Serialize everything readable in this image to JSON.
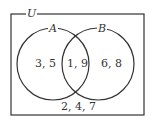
{
  "universe": {
    "label": "U",
    "elements": "2, 4, 7"
  },
  "sets": [
    {
      "label": "A",
      "only": "3, 5"
    },
    {
      "label": "B",
      "only": "6, 8"
    }
  ],
  "intersection": "1, 9",
  "colors": {
    "stroke": "#333333",
    "background": "#ffffff"
  }
}
